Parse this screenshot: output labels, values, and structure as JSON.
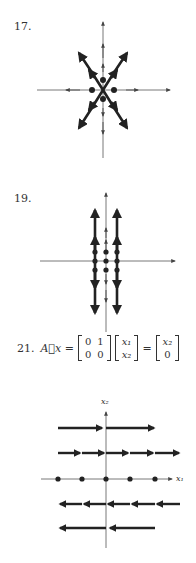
{
  "problems": [
    {
      "number": "17.",
      "figure": "phase-portrait-saddle-crossing",
      "description": "Straight-line trajectories along two crossing diagonals and both axes, all directed away from origin"
    },
    {
      "number": "19.",
      "figure": "phase-portrait-vertical-lines",
      "description": "Three vertical lines of trajectories (x = -1, 0, 1) with equilibria on horizontal axis, arrows pointing outward vertically"
    },
    {
      "number": "21.",
      "equation": {
        "lhs": "A⃗x =",
        "lhs_matrix": [
          [
            "0",
            "1"
          ],
          [
            "0",
            "0"
          ]
        ],
        "vector": [
          "x₁",
          "x₂"
        ],
        "equals": "=",
        "result": [
          "x₂",
          "0"
        ]
      },
      "figure": "phase-portrait-shear",
      "axis_labels": {
        "x": "x₁",
        "y": "x₂"
      },
      "description": "Horizontal flow: rightward above x1-axis, leftward below, equilibria along x1-axis"
    }
  ],
  "colors": {
    "ink": "#222222",
    "axis": "#555555",
    "background": "#ffffff"
  }
}
